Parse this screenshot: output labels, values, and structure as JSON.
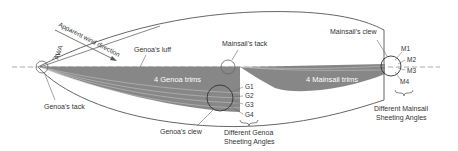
{
  "diagram": {
    "labels": {
      "apparent_wind": "Apparent wind direction",
      "awa": "AWA",
      "genoa_luff": "Genoa's luff",
      "genoa_tack": "Genoa's tack",
      "mainsail_tack": "Mainsail's tack",
      "mainsail_clew": "Mainsail's clew",
      "genoa_clew": "Genoa's clew",
      "genoa_trims": "4 Genoa trims",
      "mainsail_trims": "4 Mainsail trims",
      "genoa_angles_line1": "Different Genoa",
      "genoa_angles_line2": "Sheeting Angles",
      "mainsail_angles_line1": "Different Mainsail",
      "mainsail_angles_line2": "Sheeting Angles"
    },
    "genoa_positions": [
      "G1",
      "G2",
      "G3",
      "G4"
    ],
    "mainsail_positions": [
      "M1",
      "M2",
      "M3",
      "M4"
    ],
    "colors": {
      "sail_fill": "#7a7a7a",
      "outline": "#555555",
      "centerline": "#aaaaaa",
      "text": "#333333"
    }
  }
}
